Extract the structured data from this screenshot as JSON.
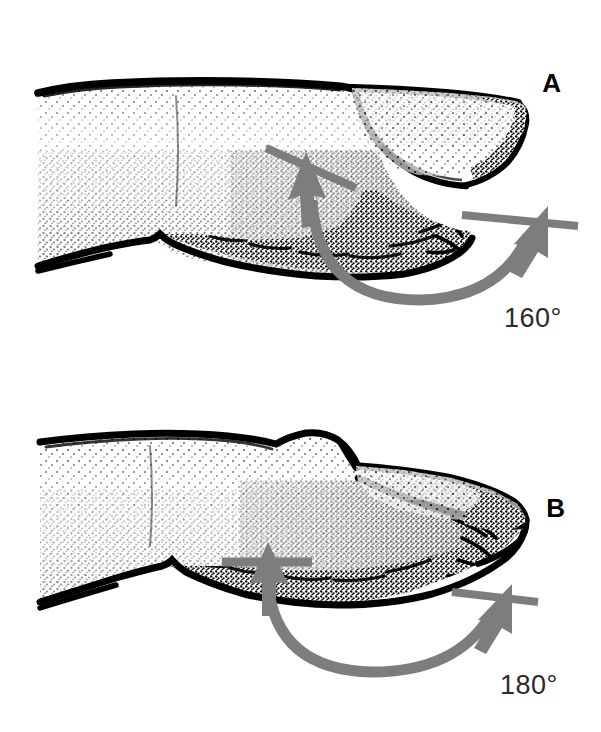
{
  "figure": {
    "background_color": "#ffffff",
    "ink_color": "#000000",
    "marker_color": "#7d7d7d"
  },
  "panels": [
    {
      "id": "a",
      "letter": "A",
      "angle_label": "160°",
      "angle_value": 160,
      "condition": "normal",
      "description": "Normal finger in lateral profile: nail plate with visible lunula meets the proximal nail fold at approximately 160 degrees."
    },
    {
      "id": "b",
      "letter": "B",
      "angle_label": "180°",
      "angle_value": 180,
      "condition": "clubbing",
      "description": "Clubbed finger in lateral profile: flattened elongated nail plate and bulbous distal phalanx; the nail fold angle has flattened to approximately 180 degrees."
    }
  ]
}
